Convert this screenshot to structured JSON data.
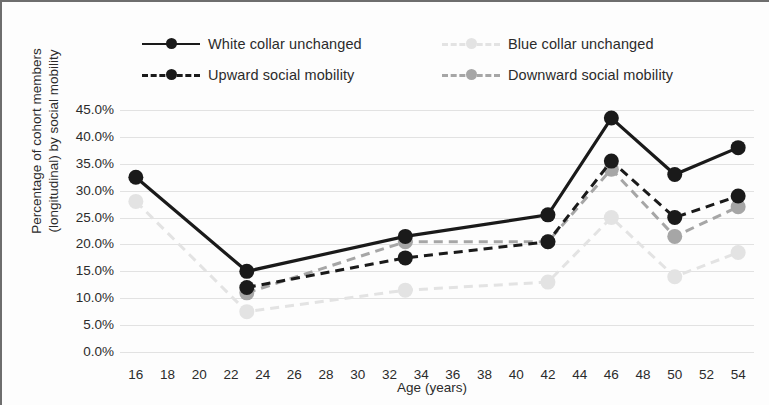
{
  "chart_data": {
    "type": "line",
    "title": "",
    "xlabel": "Age (years)",
    "ylabel": "Percentage of cohort members (longitudinal) by social mobility",
    "grid": true,
    "legend_position": "top",
    "xlim": [
      15,
      55
    ],
    "ylim": [
      0,
      45
    ],
    "x_tick_labels": [
      "16",
      "18",
      "20",
      "22",
      "24",
      "26",
      "28",
      "30",
      "32",
      "34",
      "36",
      "38",
      "40",
      "42",
      "44",
      "46",
      "48",
      "50",
      "52",
      "54"
    ],
    "x_tick_values": [
      16,
      18,
      20,
      22,
      24,
      26,
      28,
      30,
      32,
      34,
      36,
      38,
      40,
      42,
      44,
      46,
      48,
      50,
      52,
      54
    ],
    "y_tick_labels": [
      "0.0%",
      "5.0%",
      "10.0%",
      "15.0%",
      "20.0%",
      "25.0%",
      "30.0%",
      "35.0%",
      "40.0%",
      "45.0%"
    ],
    "y_tick_values": [
      0,
      5,
      10,
      15,
      20,
      25,
      30,
      35,
      40,
      45
    ],
    "x": [
      16,
      23,
      33,
      42,
      46,
      50,
      54
    ],
    "series": [
      {
        "name": "White collar unchanged",
        "color": "#1a1a1a",
        "style": "solid",
        "x": [
          16,
          23,
          33,
          42,
          46,
          50,
          54
        ],
        "values": [
          32.5,
          15.0,
          21.5,
          25.5,
          43.5,
          33.0,
          38.0
        ]
      },
      {
        "name": "Blue collar unchanged",
        "color": "#e3e3e3",
        "style": "dashed",
        "x": [
          16,
          23,
          33,
          42,
          46,
          50,
          54
        ],
        "values": [
          28.0,
          7.5,
          11.5,
          13.0,
          25.0,
          14.0,
          18.5
        ]
      },
      {
        "name": "Upward social mobility",
        "color": "#1a1a1a",
        "style": "dashed",
        "x": [
          23,
          33,
          42,
          46,
          50,
          54
        ],
        "values": [
          12.0,
          17.5,
          20.5,
          35.5,
          25.0,
          29.0
        ]
      },
      {
        "name": "Downward social mobility",
        "color": "#a6a6a6",
        "style": "dashed",
        "x": [
          23,
          33,
          42,
          46,
          50,
          54
        ],
        "values": [
          11.0,
          20.5,
          20.5,
          34.0,
          21.5,
          27.0
        ]
      }
    ]
  },
  "legend": {
    "rows": [
      [
        {
          "label": "White collar unchanged",
          "color": "#1a1a1a",
          "style": "solid"
        },
        {
          "label": "Blue collar unchanged",
          "color": "#e3e3e3",
          "style": "dashed"
        }
      ],
      [
        {
          "label": "Upward social mobility",
          "color": "#1a1a1a",
          "style": "dashed"
        },
        {
          "label": "Downward social mobility",
          "color": "#a6a6a6",
          "style": "dashed"
        }
      ]
    ]
  }
}
